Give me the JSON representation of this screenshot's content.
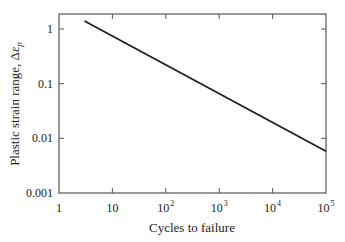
{
  "chart_data": {
    "type": "line",
    "title": "",
    "xlabel": "Cycles to failure",
    "ylabel": "Plastic strain range, Δε",
    "ylabel_subscript": "p",
    "xscale": "log",
    "yscale": "log",
    "xlim": [
      1,
      100000
    ],
    "ylim": [
      0.001,
      2
    ],
    "x_ticks": [
      {
        "value": 1,
        "base": "1",
        "exp": ""
      },
      {
        "value": 10,
        "base": "10",
        "exp": ""
      },
      {
        "value": 100,
        "base": "10",
        "exp": "2"
      },
      {
        "value": 1000,
        "base": "10",
        "exp": "3"
      },
      {
        "value": 10000,
        "base": "10",
        "exp": "4"
      },
      {
        "value": 100000,
        "base": "10",
        "exp": "5"
      }
    ],
    "y_ticks": [
      {
        "value": 1,
        "label": "1"
      },
      {
        "value": 0.1,
        "label": "0.1"
      },
      {
        "value": 0.01,
        "label": "0.01"
      },
      {
        "value": 0.001,
        "label": "0.001"
      }
    ],
    "grid": false,
    "legend": null,
    "series": [
      {
        "name": "Coffin-Manson relation",
        "x": [
          3,
          100000
        ],
        "y": [
          1.4,
          0.0058
        ]
      }
    ]
  }
}
